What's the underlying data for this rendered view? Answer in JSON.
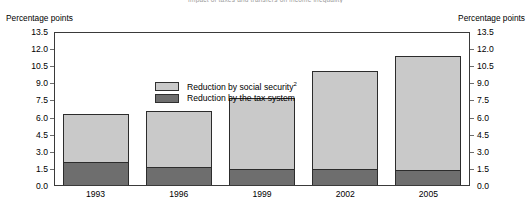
{
  "figure": {
    "title_clipped": "Impact of taxes and transfers on income inequality",
    "axis_caption_left": "Percentage points",
    "axis_caption_right": "Percentage points"
  },
  "chart_data": {
    "type": "bar",
    "subtype": "stacked-vertical",
    "title": "",
    "xlabel": "",
    "ylabel": "Percentage points",
    "ylim": [
      0.0,
      13.5
    ],
    "ytick_step": 1.5,
    "ytick_labels": [
      "13.5",
      "12.0",
      "10.5",
      "9.0",
      "7.5",
      "6.0",
      "4.5",
      "3.0",
      "1.5",
      "0.0"
    ],
    "ytick_values": [
      13.5,
      12.0,
      10.5,
      9.0,
      7.5,
      6.0,
      4.5,
      3.0,
      1.5,
      0.0
    ],
    "dual_axis": true,
    "right_axis_same_as_left": true,
    "grid": false,
    "legend_position": "inside-upper-left",
    "categories": [
      "1993",
      "1996",
      "1999",
      "2002",
      "2005"
    ],
    "series": [
      {
        "name": "Reduction by the tax system",
        "name_plain": "Reduction by the tax system",
        "color": "#6e6e6e",
        "stack_order": 1,
        "values": [
          2.0,
          1.6,
          1.4,
          1.4,
          1.3
        ]
      },
      {
        "name": "Reduction by social security",
        "name_plain": "Reduction by social security",
        "footnote_marker": "2",
        "color": "#c9c9c9",
        "stack_order": 2,
        "values": [
          4.2,
          4.9,
          6.2,
          8.6,
          10.0
        ]
      }
    ],
    "totals": [
      6.2,
      6.5,
      7.6,
      10.0,
      11.3
    ]
  },
  "legend": {
    "items": [
      {
        "label": "Reduction by social security",
        "sup": "2",
        "color": "#c9c9c9"
      },
      {
        "label": "Reduction by the tax system",
        "sup": "",
        "color": "#6e6e6e"
      }
    ]
  },
  "colors": {
    "social_security": "#c9c9c9",
    "tax_system": "#6e6e6e",
    "border": "#2c2c2c",
    "axis": "#3a3a3a",
    "text": "#000000"
  }
}
